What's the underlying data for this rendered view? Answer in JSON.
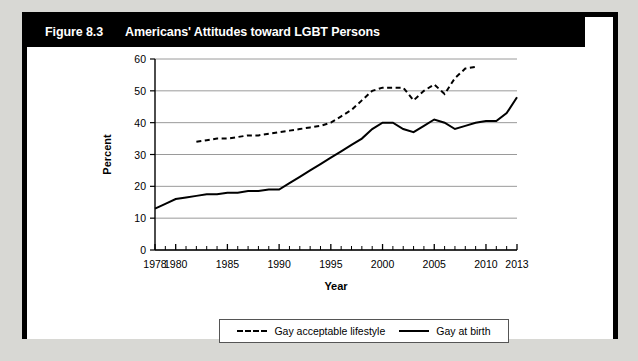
{
  "figure": {
    "label": "Figure 8.3",
    "title": "Americans' Attitudes toward LGBT Persons"
  },
  "chart_data": {
    "type": "line",
    "title": "Americans' Attitudes toward LGBT Persons",
    "xlabel": "Year",
    "ylabel": "Percent",
    "xlim": [
      1978,
      2013
    ],
    "ylim": [
      0,
      60
    ],
    "yticks": [
      0,
      10,
      20,
      30,
      40,
      50,
      60
    ],
    "xticks": [
      1978,
      1980,
      1985,
      1990,
      1995,
      2000,
      2005,
      2010,
      2013
    ],
    "xtick_labels": [
      "1978",
      "1980",
      "1985",
      "1990",
      "1995",
      "2000",
      "2005",
      "2010",
      "2013"
    ],
    "ytick_labels": [
      "0",
      "10",
      "20",
      "30",
      "40",
      "50",
      "60"
    ],
    "minor_xticks_every": 1,
    "grid": "horizontal",
    "legend_position": "below-center",
    "series": [
      {
        "name": "Gay acceptable lifestyle",
        "style": "dashed",
        "color": "#000000",
        "x": [
          1982,
          1983,
          1984,
          1985,
          1986,
          1987,
          1988,
          1989,
          1990,
          1991,
          1992,
          1993,
          1994,
          1995,
          1996,
          1997,
          1998,
          1999,
          2000,
          2001,
          2002,
          2003,
          2004,
          2005,
          2006,
          2007,
          2008,
          2009
        ],
        "values": [
          34,
          34.5,
          35,
          35,
          35.5,
          36,
          36,
          36.5,
          37,
          37.5,
          38,
          38.5,
          39,
          40,
          42,
          44,
          47,
          50,
          51,
          51,
          51,
          47,
          50,
          52,
          49,
          54,
          57,
          57.5
        ]
      },
      {
        "name": "Gay at birth",
        "style": "solid",
        "color": "#000000",
        "x": [
          1978,
          1979,
          1980,
          1981,
          1982,
          1983,
          1984,
          1985,
          1986,
          1987,
          1988,
          1989,
          1990,
          1991,
          1992,
          1993,
          1994,
          1995,
          1996,
          1997,
          1998,
          1999,
          2000,
          2001,
          2002,
          2003,
          2004,
          2005,
          2006,
          2007,
          2008,
          2009,
          2010,
          2011,
          2012,
          2013
        ],
        "values": [
          13,
          14.5,
          16,
          16.5,
          17,
          17.5,
          17.5,
          18,
          18,
          18.5,
          18.5,
          19,
          19,
          21,
          23,
          25,
          27,
          29,
          31,
          33,
          35,
          38,
          40,
          40,
          38,
          37,
          39,
          41,
          40,
          38,
          39,
          40,
          40.5,
          40.5,
          43,
          48
        ]
      }
    ],
    "legend": [
      {
        "label": "Gay acceptable lifestyle",
        "style": "dashed"
      },
      {
        "label": "Gay at birth",
        "style": "solid"
      }
    ]
  }
}
